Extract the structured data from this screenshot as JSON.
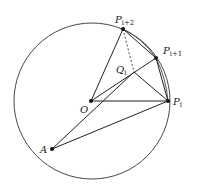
{
  "diagram": {
    "points": {
      "O": {
        "label": "O",
        "sub": ""
      },
      "P_i": {
        "label": "P",
        "sub": "i"
      },
      "P_i1": {
        "label": "P",
        "sub": "i+1"
      },
      "P_i2": {
        "label": "P",
        "sub": "i+2"
      },
      "Q_i": {
        "label": "Q",
        "sub": "i"
      },
      "A": {
        "label": "A",
        "sub": ""
      }
    },
    "segments": [
      [
        "O",
        "P_i"
      ],
      [
        "O",
        "P_i1"
      ],
      [
        "O",
        "P_i2"
      ],
      [
        "P_i2",
        "P_i"
      ],
      [
        "P_i",
        "P_i1"
      ],
      [
        "P_i1",
        "P_i2"
      ],
      [
        "A",
        "P_i"
      ],
      [
        "A",
        "Q_i"
      ],
      [
        "P_i",
        "Q_i"
      ]
    ],
    "dashed_segments": [
      [
        "P_i2",
        "Q_i"
      ]
    ],
    "colors": {
      "stroke": "#222222",
      "background": "#ffffff"
    }
  }
}
